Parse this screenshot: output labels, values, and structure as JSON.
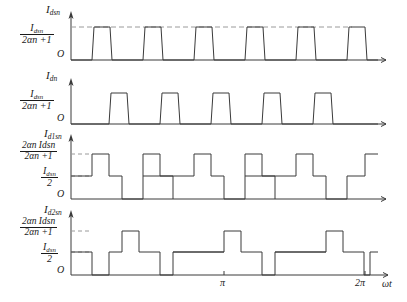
{
  "figure": {
    "type": "waveform-diagram"
  },
  "axes": {
    "origin_label": "O",
    "x_axis_label": "ωt",
    "x_ticks": [
      "π",
      "2π"
    ],
    "x_range": [
      0,
      6.2832
    ]
  },
  "panels": [
    {
      "id": "panel-1",
      "y_axis_label_main": "I",
      "y_axis_label_sub": "dsn",
      "level_label": {
        "numerator_main": "I",
        "numerator_sub": "dsn",
        "denominator": "2αn +1"
      },
      "origin": "O",
      "waveform": "trapezoidal-pulse-train",
      "pulse_count": 6
    },
    {
      "id": "panel-2",
      "y_axis_label_main": "I",
      "y_axis_label_sub": "dn",
      "level_label": {
        "numerator_main": "I",
        "numerator_sub": "dsn",
        "denominator": "2αn +1"
      },
      "origin": "O",
      "waveform": "trapezoidal-pulse-train",
      "pulse_count": 5
    },
    {
      "id": "panel-3",
      "y_axis_label_main": "I",
      "y_axis_label_sub": "d1sn",
      "level_label_upper": {
        "numerator": "2αn Idsn",
        "denominator": "2αn +1"
      },
      "level_label_lower": {
        "numerator_main": "I",
        "numerator_sub": "dsn",
        "denominator": "2"
      },
      "origin": "O",
      "waveform": "multi-level-staircase",
      "pulse_count": 6
    },
    {
      "id": "panel-4",
      "y_axis_label_main": "I",
      "y_axis_label_sub": "d2sn",
      "level_label_upper": {
        "numerator": "2αn Idsn",
        "denominator": "2αn +1"
      },
      "level_label_lower": {
        "numerator_main": "I",
        "numerator_sub": "dsn",
        "denominator": "2"
      },
      "origin": "O",
      "waveform": "multi-level-staircase",
      "pulse_count": 5
    }
  ],
  "style": {
    "stroke": "#3a3a3a",
    "dashed": "#9a9a9a",
    "text": "#1a1a1a"
  }
}
